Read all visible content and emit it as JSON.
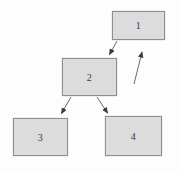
{
  "diagram": {
    "type": "flowchart",
    "colors": {
      "background": "#fdfdfd",
      "node_fill": "#dcdcdc",
      "node_border": "#8f8f8f",
      "edge_stroke": "#6a6a6a",
      "arrowhead_fill": "#3a3a3a",
      "label_color": "#3a3a3a"
    },
    "nodes": [
      {
        "id": "1",
        "label": "1"
      },
      {
        "id": "2",
        "label": "2"
      },
      {
        "id": "3",
        "label": "3"
      },
      {
        "id": "4",
        "label": "4"
      }
    ],
    "edges": [
      {
        "from": "1",
        "to": "2",
        "style": "arrow"
      },
      {
        "from": "2",
        "to": "3",
        "style": "arrow"
      },
      {
        "from": "2",
        "to": "4",
        "style": "arrow"
      },
      {
        "from": null,
        "to": "1",
        "style": "arrow",
        "note": "detached diagonal arrow pointing up-right toward box 1"
      }
    ]
  }
}
